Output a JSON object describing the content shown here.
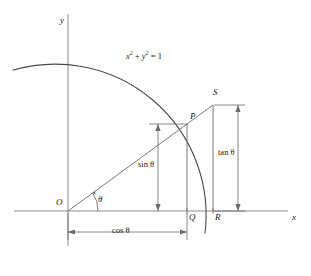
{
  "figure": {
    "kind": "unit-circle-trig-diagram",
    "background": "#ffffff",
    "stroke_color": "#4a4a4a",
    "text_color": "#1a1a1a",
    "width": 311,
    "height": 276
  },
  "axes": {
    "x_label": "x",
    "y_label": "y",
    "origin_px": {
      "x": 68,
      "y": 211
    },
    "x_axis_y_px": 211,
    "y_axis_x_px": 68,
    "x_axis_from_px": 14,
    "x_axis_to_px": 288,
    "y_axis_from_px": 14,
    "y_axis_to_px": 246
  },
  "curve": {
    "equation_label": "x² + y² = 1",
    "equation_parts": {
      "x": "x",
      "x_exp": "2",
      "plus": " + ",
      "y": "y",
      "y_exp": "2",
      "equals": " = ",
      "one": "1"
    },
    "radius_px": 151,
    "description": "arc of the unit circle"
  },
  "points": [
    {
      "id": "O",
      "label": "O",
      "x_px": 68,
      "y_px": 211,
      "desc": "origin"
    },
    {
      "id": "P",
      "label": "P",
      "x_px": 187,
      "y_px": 124,
      "desc": "point on unit circle"
    },
    {
      "id": "Q",
      "label": "Q",
      "x_px": 187,
      "y_px": 211,
      "desc": "foot of perpendicular from P"
    },
    {
      "id": "R",
      "label": "R",
      "x_px": 213,
      "y_px": 211,
      "desc": "circle meets x-axis"
    },
    {
      "id": "S",
      "label": "S",
      "x_px": 213,
      "y_px": 105,
      "desc": "ray OP meets tangent at R"
    }
  ],
  "angle": {
    "label": "θ",
    "vertex": "O",
    "arc_radius_px": 30,
    "value_deg": 36
  },
  "measures": [
    {
      "id": "sin",
      "label": "sin θ",
      "orientation": "vertical",
      "from_px": {
        "x": 158,
        "y": 124
      },
      "to_px": {
        "x": 158,
        "y": 211
      },
      "segment": "PQ"
    },
    {
      "id": "cos",
      "label": "cos θ",
      "orientation": "horizontal",
      "from_px": {
        "x": 68,
        "y": 232
      },
      "to_px": {
        "x": 187,
        "y": 232
      },
      "segment": "OQ"
    },
    {
      "id": "tan",
      "label": "tan θ",
      "orientation": "vertical",
      "from_px": {
        "x": 238,
        "y": 105
      },
      "to_px": {
        "x": 238,
        "y": 211
      },
      "segment": "RS"
    }
  ],
  "segments": [
    {
      "id": "OS",
      "desc": "ray from origin through P to S"
    },
    {
      "id": "PQ",
      "desc": "vertical from P down to x-axis at Q"
    },
    {
      "id": "RS",
      "desc": "vertical tangent from R up to S"
    }
  ]
}
